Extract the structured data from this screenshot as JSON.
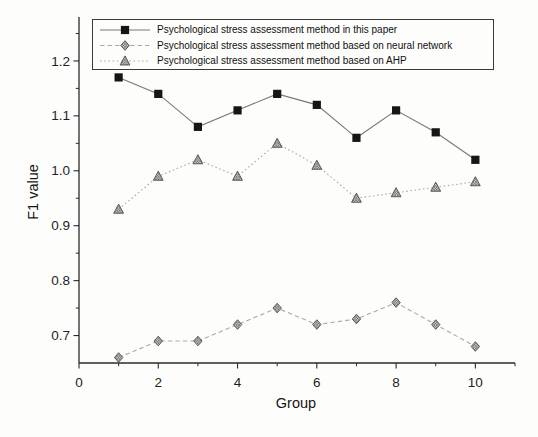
{
  "figure": {
    "background_color": "#fdfdfb",
    "axis_color": "#2a2a2a",
    "text_color": "#161616",
    "legend_border_color": "#3a3a3a",
    "series1_line_color": "#787878",
    "series23_line_color": "#a9a9a9",
    "square_marker_color": "#161616",
    "hatch_marker_base_color": "#cccccc",
    "hatch_marker_line_color": "#4d4d4d"
  },
  "chart_data": {
    "type": "line",
    "title": "",
    "xlabel": "Group",
    "ylabel": "F1 value",
    "x": [
      1,
      2,
      3,
      4,
      5,
      6,
      7,
      8,
      9,
      10
    ],
    "xlim": [
      0,
      11
    ],
    "ylim": [
      0.65,
      1.28
    ],
    "x_major_ticks": [
      0,
      2,
      4,
      6,
      8,
      10
    ],
    "x_minor_ticks": [
      1,
      3,
      5,
      7,
      9,
      11
    ],
    "y_major_ticks": [
      0.7,
      0.8,
      0.9,
      1.0,
      1.1,
      1.2
    ],
    "y_minor_ticks": [
      0.75,
      0.85,
      0.95,
      1.05,
      1.15,
      1.25
    ],
    "grid": false,
    "legend_position": "top-inside",
    "series": [
      {
        "name": "Psychological stress assessment method in this paper",
        "marker": "square",
        "line_style": "solid",
        "values": [
          1.17,
          1.14,
          1.08,
          1.11,
          1.14,
          1.12,
          1.06,
          1.11,
          1.07,
          1.02
        ]
      },
      {
        "name": "Psychological stress assessment method based on neural network",
        "marker": "diamond",
        "line_style": "dashed",
        "values": [
          0.66,
          0.69,
          0.69,
          0.72,
          0.75,
          0.72,
          0.73,
          0.76,
          0.72,
          0.68
        ]
      },
      {
        "name": "Psychological stress assessment method based on AHP",
        "marker": "triangle",
        "line_style": "dotted",
        "values": [
          0.93,
          0.99,
          1.02,
          0.99,
          1.05,
          1.01,
          0.95,
          0.96,
          0.97,
          0.98
        ]
      }
    ]
  }
}
